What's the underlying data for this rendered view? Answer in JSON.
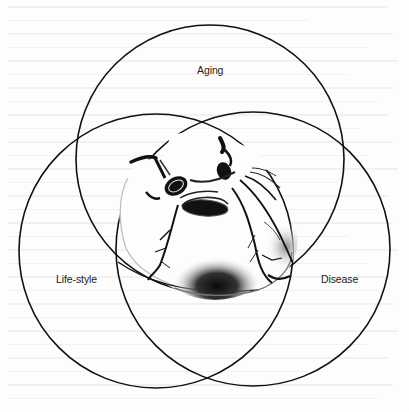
{
  "diagram": {
    "type": "venn",
    "sets": [
      {
        "id": "aging",
        "label": "Aging",
        "cx": 210,
        "cy": 159,
        "r": 134
      },
      {
        "id": "lifestyle",
        "label": "Life-style",
        "cx": 156,
        "cy": 251,
        "r": 137
      },
      {
        "id": "disease",
        "label": "Disease",
        "cx": 253,
        "cy": 249,
        "r": 137
      }
    ],
    "center_illustration": "heart-illustration",
    "colors": {
      "stroke": "#111111",
      "background": "#fdfdfd",
      "ink": "#1a1a1a"
    }
  }
}
